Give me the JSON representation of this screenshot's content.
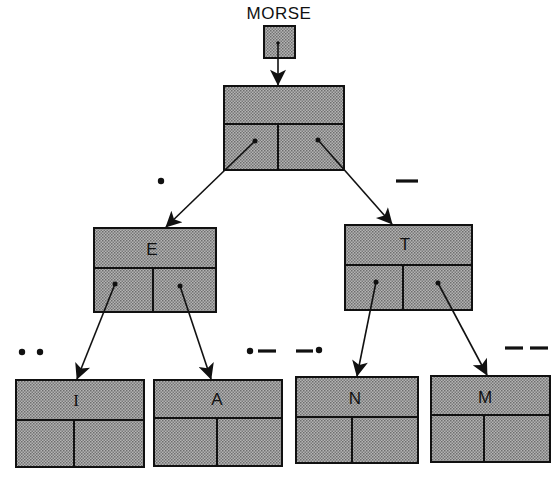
{
  "title": "MORSE",
  "colors": {
    "box_fill": "#9a9a9a",
    "stroke": "#111111",
    "background": "#ffffff"
  },
  "root_pointer": {
    "label": "MORSE",
    "x": 264,
    "y": 26,
    "w": 31,
    "h": 32
  },
  "nodes": [
    {
      "id": "root",
      "letter": "",
      "x": 224,
      "y": 86,
      "w": 120,
      "h": 84,
      "split_y": 124,
      "split_x": 278
    },
    {
      "id": "E",
      "letter": "E",
      "x": 94,
      "y": 228,
      "w": 122,
      "h": 84,
      "split_y": 268,
      "split_x": 153
    },
    {
      "id": "T",
      "letter": "T",
      "x": 345,
      "y": 225,
      "w": 127,
      "h": 85,
      "split_y": 265,
      "split_x": 403
    },
    {
      "id": "I",
      "letter": "I",
      "x": 16,
      "y": 380,
      "w": 128,
      "h": 87,
      "split_y": 420,
      "split_x": 74
    },
    {
      "id": "A",
      "letter": "A",
      "x": 154,
      "y": 380,
      "w": 128,
      "h": 86,
      "split_y": 418,
      "split_x": 217
    },
    {
      "id": "N",
      "letter": "N",
      "x": 296,
      "y": 377,
      "w": 122,
      "h": 86,
      "split_y": 417,
      "split_x": 352
    },
    {
      "id": "M",
      "letter": "M",
      "x": 431,
      "y": 376,
      "w": 119,
      "h": 86,
      "split_y": 415,
      "split_x": 484
    }
  ],
  "edges": [
    {
      "from": "root",
      "to": "E",
      "code": ".",
      "label": "dot"
    },
    {
      "from": "root",
      "to": "T",
      "code": "-",
      "label": "dash"
    },
    {
      "from": "E",
      "to": "I",
      "code": "..",
      "label": "dot dot"
    },
    {
      "from": "E",
      "to": "A",
      "code": ".-",
      "label": "dot dash"
    },
    {
      "from": "T",
      "to": "N",
      "code": "-.",
      "label": "dash dot"
    },
    {
      "from": "T",
      "to": "M",
      "code": "--",
      "label": "dash dash"
    }
  ]
}
